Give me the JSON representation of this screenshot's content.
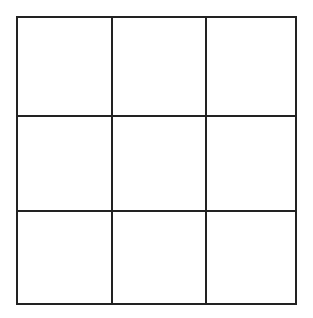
{
  "grid": {
    "rows": 3,
    "cols": 3,
    "line_color": "#222222",
    "background": "#ffffff",
    "cells": [
      [
        "",
        "",
        ""
      ],
      [
        "",
        "",
        ""
      ],
      [
        "",
        "",
        ""
      ]
    ]
  }
}
